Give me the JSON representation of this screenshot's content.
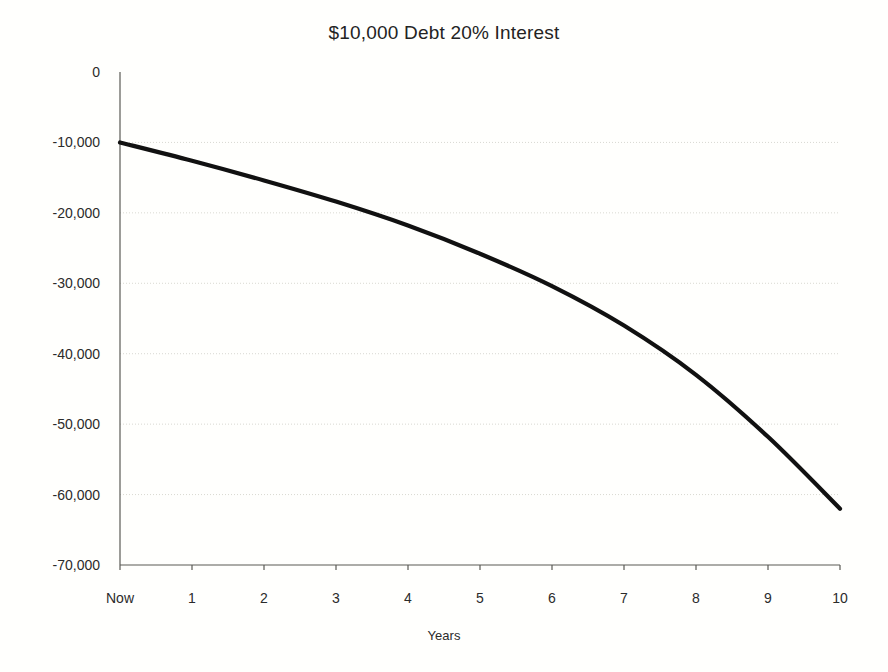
{
  "chart_data": {
    "type": "line",
    "title": "$10,000 Debt 20% Interest",
    "xlabel": "Years",
    "ylabel": "",
    "categories": [
      "Now",
      "1",
      "2",
      "3",
      "4",
      "5",
      "6",
      "7",
      "8",
      "9",
      "10"
    ],
    "x": [
      0,
      1,
      2,
      3,
      4,
      5,
      6,
      7,
      8,
      9,
      10
    ],
    "values": [
      -10000,
      -12600,
      -15400,
      -18400,
      -21800,
      -25800,
      -30400,
      -36000,
      -43000,
      -51800,
      -62000
    ],
    "series": [
      {
        "name": "Debt balance",
        "values": [
          -10000,
          -12600,
          -15400,
          -18400,
          -21800,
          -25800,
          -30400,
          -36000,
          -43000,
          -51800,
          -62000
        ]
      }
    ],
    "ylim": [
      -70000,
      0
    ],
    "xlim": [
      0,
      10
    ],
    "ytick_labels": [
      "0",
      "-10,000",
      "-20,000",
      "-30,000",
      "-40,000",
      "-50,000",
      "-60,000",
      "-70,000"
    ],
    "ytick_values": [
      0,
      -10000,
      -20000,
      -30000,
      -40000,
      -50000,
      -60000,
      -70000
    ],
    "grid": true,
    "grid_axis": "y",
    "legend": "none",
    "line_color": "#111111",
    "grid_color": "#d9d9d2",
    "axis_color": "#5a5a55",
    "background_color": "#fffffd"
  }
}
